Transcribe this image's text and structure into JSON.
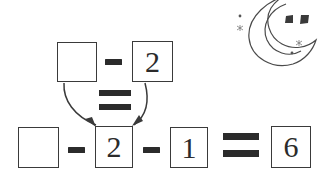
{
  "page": {
    "background_color": "#ffffff",
    "ink_color": "#2b2b2b",
    "line_color": "#3a3a3a"
  },
  "equations": {
    "top": {
      "name": "top-equation",
      "cells": [
        {
          "kind": "box",
          "value": "",
          "blank": true,
          "label": "unknown-box"
        },
        {
          "kind": "operator",
          "value": "-",
          "label": "minus-sign"
        },
        {
          "kind": "box",
          "value": "2",
          "blank": false,
          "label": "two-box"
        }
      ]
    },
    "middle": {
      "name": "middle-relation",
      "operator": "=",
      "label": "equals-sign"
    },
    "bottom": {
      "name": "bottom-equation",
      "cells": [
        {
          "kind": "box",
          "value": "",
          "blank": true,
          "label": "unknown-box"
        },
        {
          "kind": "operator",
          "value": "-",
          "label": "minus-sign"
        },
        {
          "kind": "box",
          "value": "2",
          "blank": false,
          "label": "two-box"
        },
        {
          "kind": "operator",
          "value": "-",
          "label": "minus-sign"
        },
        {
          "kind": "box",
          "value": "1",
          "blank": false,
          "label": "one-box"
        },
        {
          "kind": "operator",
          "value": "=",
          "label": "equals-sign"
        },
        {
          "kind": "box",
          "value": "6",
          "blank": false,
          "label": "six-box"
        }
      ]
    }
  },
  "annotations": {
    "arrows": [
      {
        "name": "arrow-left",
        "from": "top-blank-box",
        "to": "bottom-two-box",
        "direction": "down-right"
      },
      {
        "name": "arrow-right",
        "from": "top-two-box",
        "to": "bottom-two-box",
        "direction": "down-left"
      }
    ]
  },
  "decoration": {
    "moon": {
      "name": "crescent-moon",
      "eyes": 2,
      "sparkles": 4,
      "color": "#4a4a4a"
    }
  }
}
